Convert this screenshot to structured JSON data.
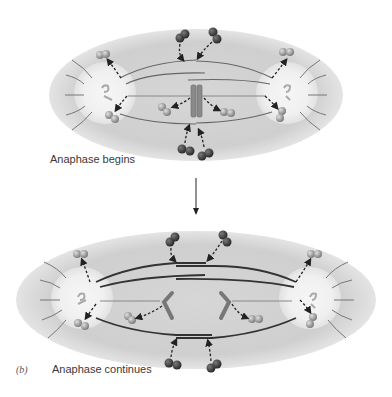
{
  "figure": {
    "panel_letter": "(b)",
    "stages": [
      {
        "id": "top",
        "label": "Anaphase begins"
      },
      {
        "id": "bottom",
        "label": "Anaphase continues"
      }
    ],
    "colors": {
      "cell": "#d2d2d2",
      "centrosome_glow": "#f3f3f3",
      "microtubule": "#555555",
      "kinetochore_mt": "#7a7a7a",
      "chromosome": "#8a8a8a",
      "subunit_dark": "#3c3c3c",
      "subunit_light": "#a8a8a8",
      "arrow": "#222222"
    }
  }
}
